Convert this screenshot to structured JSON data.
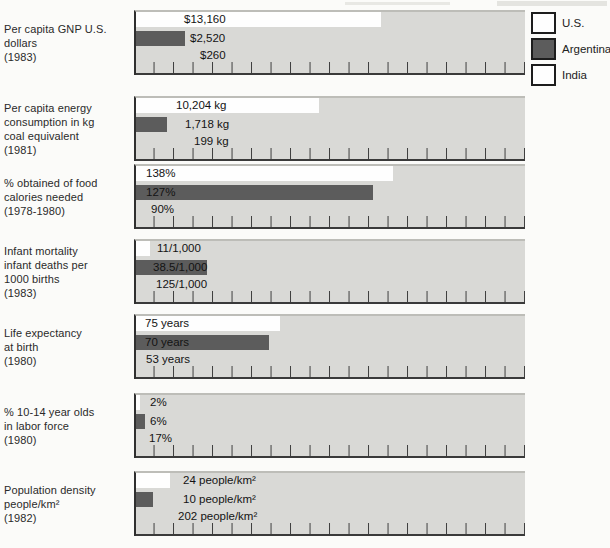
{
  "colors": {
    "panel_bg": "#d9d9d6",
    "us_bar": "#fefefe",
    "ar_bar": "#5c5c5c",
    "in_bar": "#d9d9d6",
    "axis": "#3a3a3a"
  },
  "legend": [
    {
      "label": "U.S.",
      "swatch": "#fefefe"
    },
    {
      "label": "Argentina",
      "swatch": "#5c5c5c"
    },
    {
      "label": "India",
      "swatch": "#fefefe"
    }
  ],
  "panels": [
    {
      "label_lines": [
        "Per capita GNP U.S.",
        "dollars",
        "(1983)"
      ],
      "rows": [
        {
          "country": "U.S.",
          "value": "$13,160",
          "bar_pct": 63,
          "label_x": 48
        },
        {
          "country": "Argentina",
          "value": "$2,520",
          "bar_pct": 12.5,
          "label_x": 54
        },
        {
          "country": "India",
          "value": "$260",
          "bar_pct": 1.3,
          "label_x": 64
        }
      ]
    },
    {
      "label_lines": [
        "Per capita energy",
        "consumption in kg",
        "coal equivalent",
        "(1981)"
      ],
      "rows": [
        {
          "country": "U.S.",
          "value": "10,204 kg",
          "bar_pct": 47,
          "label_x": 40
        },
        {
          "country": "Argentina",
          "value": "1,718 kg",
          "bar_pct": 7.9,
          "label_x": 49
        },
        {
          "country": "India",
          "value": "199 kg",
          "bar_pct": 0.9,
          "label_x": 58
        }
      ]
    },
    {
      "label_lines": [
        "% obtained of food",
        "calories needed",
        "(1978-1980)"
      ],
      "rows": [
        {
          "country": "U.S.",
          "value": "138%",
          "bar_pct": 66,
          "label_x": 10
        },
        {
          "country": "Argentina",
          "value": "127%",
          "bar_pct": 61,
          "label_x": 10
        },
        {
          "country": "India",
          "value": "90%",
          "bar_pct": 43,
          "label_x": 15
        }
      ]
    },
    {
      "label_lines": [
        "Infant mortality",
        "infant deaths per",
        "1000 births",
        "(1983)"
      ],
      "rows": [
        {
          "country": "U.S.",
          "value": "11/1,000",
          "bar_pct": 3.6,
          "label_x": 21
        },
        {
          "country": "Argentina",
          "value": "38.5/1,000",
          "bar_pct": 18.2,
          "label_x": 17
        },
        {
          "country": "India",
          "value": "125/1,000",
          "bar_pct": 59,
          "label_x": 20
        }
      ]
    },
    {
      "label_lines": [
        "Life expectancy",
        "at birth",
        "(1980)"
      ],
      "rows": [
        {
          "country": "U.S.",
          "value": "75 years",
          "bar_pct": 37,
          "label_x": 9
        },
        {
          "country": "Argentina",
          "value": "70 years",
          "bar_pct": 34.3,
          "label_x": 9
        },
        {
          "country": "India",
          "value": "53 years",
          "bar_pct": 26,
          "label_x": 10
        }
      ]
    },
    {
      "label_lines": [
        "% 10-14 year olds",
        "in labor force",
        "(1980)"
      ],
      "rows": [
        {
          "country": "U.S.",
          "value": "2%",
          "bar_pct": 0.9,
          "label_x": 14
        },
        {
          "country": "Argentina",
          "value": "6%",
          "bar_pct": 2.3,
          "label_x": 14
        },
        {
          "country": "India",
          "value": "17%",
          "bar_pct": 6.5,
          "label_x": 13
        }
      ]
    },
    {
      "label_lines": [
        "Population density",
        "people/km²",
        "(1982)"
      ],
      "rows": [
        {
          "country": "U.S.",
          "value": "24 people/km²",
          "bar_pct": 8.8,
          "label_x": 47
        },
        {
          "country": "Argentina",
          "value": "10 people/km²",
          "bar_pct": 4.3,
          "label_x": 47
        },
        {
          "country": "India",
          "value": "202 people/km²",
          "bar_pct": 72.5,
          "label_x": 42
        }
      ]
    }
  ],
  "chart_data": {
    "type": "bar",
    "orientation": "horizontal",
    "grouped_by": "indicator",
    "categories": [
      "Per capita GNP U.S. dollars (1983)",
      "Per capita energy consumption in kg coal equivalent (1981)",
      "% obtained of food calories needed (1978-1980)",
      "Infant mortality infant deaths per 1000 births (1983)",
      "Life expectancy at birth (1980)",
      "% 10-14 year olds in labor force (1980)",
      "Population density people/km² (1982)"
    ],
    "units": [
      "U.S. dollars",
      "kg coal equivalent",
      "%",
      "deaths per 1,000 births",
      "years",
      "%",
      "people/km²"
    ],
    "series": [
      {
        "name": "U.S.",
        "values": [
          13160,
          10204,
          138,
          11,
          75,
          2,
          24
        ],
        "value_labels": [
          "$13,160",
          "10,204 kg",
          "138%",
          "11/1,000",
          "75 years",
          "2%",
          "24 people/km²"
        ]
      },
      {
        "name": "Argentina",
        "values": [
          2520,
          1718,
          127,
          38.5,
          70,
          6,
          10
        ],
        "value_labels": [
          "$2,520",
          "1,718 kg",
          "127%",
          "38.5/1,000",
          "70 years",
          "6%",
          "10 people/km²"
        ]
      },
      {
        "name": "India",
        "values": [
          260,
          199,
          90,
          125,
          53,
          17,
          202
        ],
        "value_labels": [
          "$260",
          "199 kg",
          "90%",
          "125/1,000",
          "53 years",
          "17%",
          "202 people/km²"
        ]
      }
    ],
    "title": "",
    "xlabel": "",
    "ylabel": "",
    "legend_position": "top-right",
    "grid": false
  }
}
